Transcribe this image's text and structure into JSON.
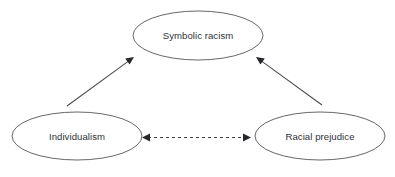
{
  "diagram": {
    "background_color": "#ffffff",
    "node_stroke_color": "#54565a",
    "text_color": "#303236",
    "edge_color": "#4a4c50",
    "nodes": [
      {
        "id": "symbolic-racism",
        "label": "Symbolic racism",
        "cx": 198,
        "cy": 35.5,
        "rx": 65,
        "ry": 24.5
      },
      {
        "id": "individualism",
        "label": "Individualism",
        "cx": 77,
        "cy": 136,
        "rx": 65,
        "ry": 24
      },
      {
        "id": "racial-prejudice",
        "label": "Racial prejudice",
        "cx": 320,
        "cy": 136,
        "rx": 65,
        "ry": 24
      }
    ],
    "edges": [
      {
        "id": "individualism-to-symbolic-racism",
        "from": "individualism",
        "to": "symbolic-racism",
        "style": "solid",
        "direction": "forward",
        "x1": 67,
        "y1": 106,
        "x2": 134,
        "y2": 57
      },
      {
        "id": "racial-prejudice-to-symbolic-racism",
        "from": "racial-prejudice",
        "to": "symbolic-racism",
        "style": "solid",
        "direction": "forward",
        "x1": 322,
        "y1": 105,
        "x2": 256,
        "y2": 57
      },
      {
        "id": "individualism-racial-prejudice-correlation",
        "from": "individualism",
        "to": "racial-prejudice",
        "style": "dashed",
        "direction": "bidirectional",
        "x1": 142,
        "y1": 137.5,
        "x2": 251,
        "y2": 137.5
      }
    ]
  }
}
